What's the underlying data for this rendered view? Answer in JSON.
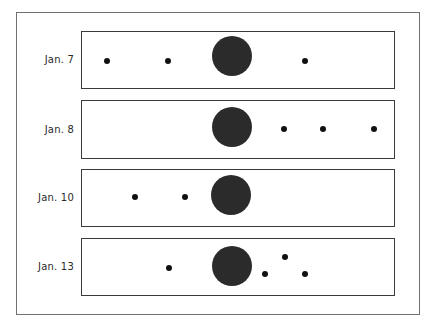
{
  "figure": {
    "colors": {
      "frame_border": "#707070",
      "panel_border": "#3a3a3a",
      "planet": "#2b2b2b",
      "moon": "#111111",
      "label": "#2a2a2a"
    },
    "rows": [
      {
        "label": "Jan. 7",
        "panel": {
          "top": 31,
          "height": 58
        },
        "planet": {
          "cx": 232,
          "cy": 56,
          "r": 20
        },
        "moons": [
          {
            "cx": 107,
            "cy": 61
          },
          {
            "cx": 168,
            "cy": 61
          },
          {
            "cx": 305,
            "cy": 61
          }
        ]
      },
      {
        "label": "Jan. 8",
        "panel": {
          "top": 100,
          "height": 59
        },
        "planet": {
          "cx": 232,
          "cy": 127,
          "r": 20
        },
        "moons": [
          {
            "cx": 284,
            "cy": 129
          },
          {
            "cx": 323,
            "cy": 129
          },
          {
            "cx": 374,
            "cy": 129
          }
        ]
      },
      {
        "label": "Jan. 10",
        "panel": {
          "top": 169,
          "height": 58
        },
        "planet": {
          "cx": 231,
          "cy": 195,
          "r": 20
        },
        "moons": [
          {
            "cx": 135,
            "cy": 197
          },
          {
            "cx": 185,
            "cy": 197
          }
        ]
      },
      {
        "label": "Jan. 13",
        "panel": {
          "top": 238,
          "height": 58
        },
        "planet": {
          "cx": 232,
          "cy": 266,
          "r": 20
        },
        "moons": [
          {
            "cx": 169,
            "cy": 268
          },
          {
            "cx": 265,
            "cy": 274
          },
          {
            "cx": 285,
            "cy": 257
          },
          {
            "cx": 305,
            "cy": 274
          }
        ]
      }
    ]
  }
}
